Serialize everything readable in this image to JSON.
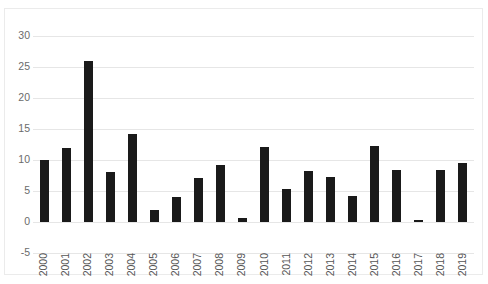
{
  "chart_data": {
    "type": "bar",
    "title": "",
    "subtitle": "",
    "xlabel": "",
    "ylabel": "",
    "categories": [
      "2000",
      "2001",
      "2002",
      "2003",
      "2004",
      "2005",
      "2006",
      "2007",
      "2008",
      "2009",
      "2010",
      "2011",
      "2012",
      "2013",
      "2014",
      "2015",
      "2016",
      "2017",
      "2018",
      "2019"
    ],
    "values": [
      10.0,
      12.0,
      26.0,
      8.0,
      14.2,
      2.0,
      4.1,
      7.1,
      9.2,
      0.6,
      12.1,
      5.3,
      8.3,
      7.3,
      4.2,
      12.3,
      8.4,
      0.4,
      8.4,
      9.5
    ],
    "ylim": [
      -5,
      30
    ],
    "ytick_labels": [
      "30",
      "25",
      "20",
      "15",
      "10",
      "5",
      "0",
      "-5"
    ],
    "ytick_values": [
      30,
      25,
      20,
      15,
      10,
      5,
      0,
      -5
    ],
    "grid": true,
    "legend": null,
    "legend_position": "none",
    "series": [
      {
        "name": "",
        "values": [
          10.0,
          12.0,
          26.0,
          8.0,
          14.2,
          2.0,
          4.1,
          7.1,
          9.2,
          0.6,
          12.1,
          5.3,
          8.3,
          7.3,
          4.2,
          12.3,
          8.4,
          0.4,
          8.4,
          9.5
        ]
      }
    ],
    "annotations": []
  },
  "style": {
    "bar_color": "#1a1a1a",
    "grid_color": "#e6e6e6",
    "frame_color": "#ebebeb",
    "tick_label_color": "#6b6b6b",
    "background": "#ffffff"
  }
}
